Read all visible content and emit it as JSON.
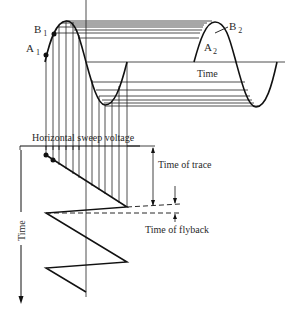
{
  "labels": {
    "a1": "A",
    "a1_sub": "1",
    "b1": "B",
    "b1_sub": "1",
    "a2": "A",
    "a2_sub": "2",
    "b2": "B",
    "b2_sub": "2",
    "time_horizontal": "Time",
    "sweep_voltage": "Horizontal sweep voltage",
    "time_of_trace": "Time of trace",
    "time_of_flyback": "Time of flyback",
    "time_vertical": "Time"
  },
  "colors": {
    "line": "#1a1a1a",
    "text": "#2a2a2a",
    "background": "#ffffff"
  }
}
